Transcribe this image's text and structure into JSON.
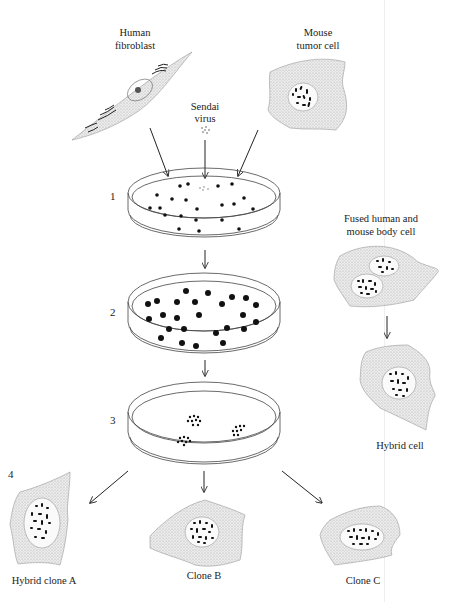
{
  "labels": {
    "human_fibroblast": [
      "Human",
      "fibroblast"
    ],
    "mouse_tumor_cell": [
      "Mouse",
      "tumor cell"
    ],
    "sendai_virus": [
      "Sendai",
      "virus"
    ],
    "fused_cell": [
      "Fused human and",
      "mouse body cell"
    ],
    "hybrid_cell": "Hybrid cell",
    "hybrid_clone_a": "Hybrid clone A",
    "clone_b": "Clone B",
    "clone_c": "Clone C"
  },
  "steps": [
    {
      "number": "1",
      "description": "Cells and Sendai virus mixed in dish"
    },
    {
      "number": "2",
      "description": "Cells multiply"
    },
    {
      "number": "3",
      "description": "Hybrid colonies"
    },
    {
      "number": "4",
      "description": "Hybrid clones"
    }
  ],
  "colors": {
    "ink": "#222222",
    "cell_fill": "#e6e6e6",
    "background": "#ffffff"
  }
}
